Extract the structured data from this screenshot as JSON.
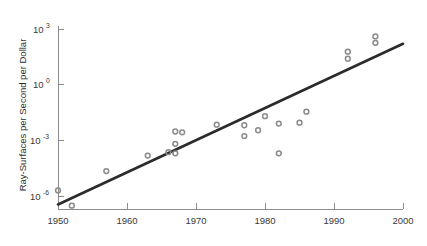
{
  "chart_data": {
    "type": "scatter",
    "title": "",
    "subtitle": "",
    "xlabel": "",
    "ylabel": "Ray-Surfaces per Second per Dollar",
    "xlim": [
      1950,
      2000
    ],
    "ylim": [
      1e-07,
      1000
    ],
    "yscale": "log",
    "xscale": "linear",
    "grid": false,
    "legend": null,
    "xticks": [
      1950,
      1960,
      1970,
      1980,
      1990,
      2000
    ],
    "xtick_labels": [
      "1950",
      "1960",
      "1970",
      "1980",
      "1990",
      "2000"
    ],
    "yticks": [
      1000,
      1,
      0.001,
      1e-06
    ],
    "ytick_labels": [
      "10^3",
      "10^0",
      "10^-3",
      "10^-6"
    ],
    "ytick_mantissas": [
      "10",
      "10",
      "10",
      "10"
    ],
    "ytick_exponents": [
      "3",
      "0",
      "-3",
      "-6"
    ],
    "series": [
      {
        "name": "Ray-surfaces per second per dollar",
        "marker": "open-circle",
        "color": "#8a8a8a",
        "points": [
          {
            "x": 1950,
            "y": 2e-06
          },
          {
            "x": 1952,
            "y": 3e-07
          },
          {
            "x": 1957,
            "y": 2.2e-05
          },
          {
            "x": 1963,
            "y": 0.00015
          },
          {
            "x": 1966,
            "y": 0.00023
          },
          {
            "x": 1967,
            "y": 0.0002
          },
          {
            "x": 1967,
            "y": 0.00065
          },
          {
            "x": 1967,
            "y": 0.003
          },
          {
            "x": 1968,
            "y": 0.0027
          },
          {
            "x": 1973,
            "y": 0.007
          },
          {
            "x": 1977,
            "y": 0.0065
          },
          {
            "x": 1977,
            "y": 0.0017
          },
          {
            "x": 1979,
            "y": 0.0035
          },
          {
            "x": 1980,
            "y": 0.02
          },
          {
            "x": 1982,
            "y": 0.0002
          },
          {
            "x": 1982,
            "y": 0.008
          },
          {
            "x": 1985,
            "y": 0.009
          },
          {
            "x": 1986,
            "y": 0.035
          },
          {
            "x": 1992,
            "y": 25.0
          },
          {
            "x": 1992,
            "y": 60.0
          },
          {
            "x": 1996,
            "y": 180.0
          },
          {
            "x": 1996,
            "y": 400.0
          }
        ]
      }
    ],
    "trend_line": {
      "name": "fit-line",
      "color": "#2b2b2b",
      "x_start": 1950,
      "y_start": 3.5e-07,
      "x_end": 2000,
      "y_end": 160.0
    }
  },
  "axis": {
    "y_title": "Ray-Surfaces per Second per Dollar"
  }
}
